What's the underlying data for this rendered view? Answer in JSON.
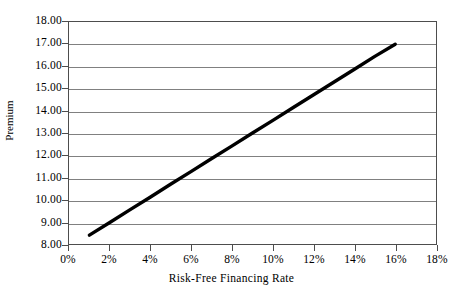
{
  "chart_data": {
    "type": "line",
    "title": "",
    "xlabel": "Risk-Free Financing Rate",
    "ylabel": "Premium",
    "xlim": [
      0,
      18
    ],
    "ylim": [
      8,
      18
    ],
    "grid": true,
    "legend": false,
    "legend_position": "none",
    "x_tick_labels": [
      "0%",
      "2%",
      "4%",
      "6%",
      "8%",
      "10%",
      "12%",
      "14%",
      "16%",
      "18%"
    ],
    "x_tick_values": [
      0,
      2,
      4,
      6,
      8,
      10,
      12,
      14,
      16,
      18
    ],
    "y_tick_labels": [
      "8.00",
      "9.00",
      "10.00",
      "11.00",
      "12.00",
      "13.00",
      "14.00",
      "15.00",
      "16.00",
      "17.00",
      "18.00"
    ],
    "y_tick_values": [
      8,
      9,
      10,
      11,
      12,
      13,
      14,
      15,
      16,
      17,
      18
    ],
    "series": [
      {
        "name": "Premium",
        "color": "#000000",
        "line_width": 3.4,
        "x": [
          1,
          2,
          3,
          4,
          5,
          6,
          7,
          8,
          9,
          10,
          11,
          12,
          13,
          14,
          15,
          16
        ],
        "values": [
          8.4,
          8.97,
          9.55,
          10.12,
          10.7,
          11.27,
          11.85,
          12.42,
          13.0,
          13.57,
          14.15,
          14.72,
          15.3,
          15.87,
          16.45,
          17.0
        ]
      }
    ]
  },
  "axes": {
    "y_axis_title": "Premium",
    "x_axis_title": "Risk-Free Financing Rate"
  },
  "colors": {
    "series_line": "#000000",
    "gridline": "#808080",
    "frame": "#4d4d4d",
    "background": "#ffffff"
  }
}
